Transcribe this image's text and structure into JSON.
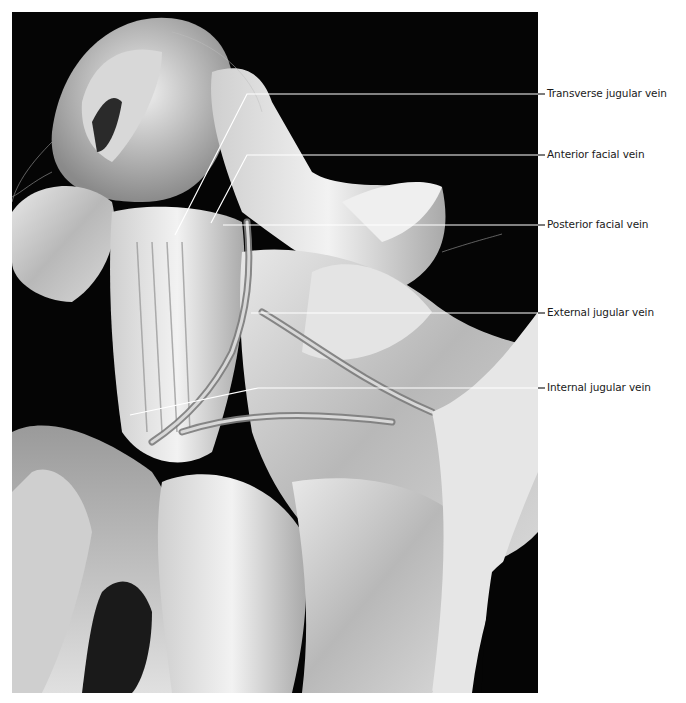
{
  "figure": {
    "type": "anatomical-photograph",
    "background_color": "#050505",
    "leader_line_color": "#ffffff",
    "label_color": "#1a1a1a"
  },
  "labels": [
    {
      "id": "transverse-jugular-vein",
      "text": "Transverse jugular vein",
      "y": 94
    },
    {
      "id": "anterior-facial-vein",
      "text": "Anterior facial vein",
      "y": 155
    },
    {
      "id": "posterior-facial-vein",
      "text": "Posterior facial vein",
      "y": 225
    },
    {
      "id": "external-jugular-vein",
      "text": "External jugular vein",
      "y": 313
    },
    {
      "id": "internal-jugular-vein",
      "text": "Internal jugular vein",
      "y": 388
    }
  ]
}
